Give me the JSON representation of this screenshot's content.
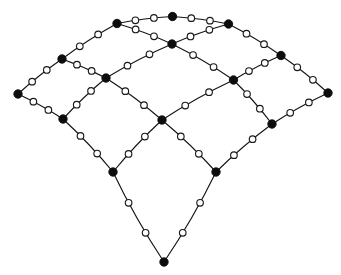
{
  "figure": {
    "background_color": "#ffffff",
    "edge_color": "#141414",
    "filled_node_color": "#0d0d0d",
    "hollow_node_fill": "#ffffff",
    "hollow_node_stroke": "#1a1a1a",
    "edge_width": 1.15,
    "filled_node_radius": 4.2,
    "hollow_node_radius": 3.3,
    "subdivisions_per_edge": 2,
    "node_legend": {
      "filled": "corner-vertex",
      "hollow": "edge-midpoint-vertex"
    }
  },
  "graph": {
    "rows": 5,
    "cols": 5,
    "corner_nodes": [
      {
        "id": "c00",
        "x": 172.5,
        "y": 16.5
      },
      {
        "id": "c01",
        "x": 117.0,
        "y": 23.5
      },
      {
        "id": "c02",
        "x": 62.0,
        "y": 59.0
      },
      {
        "id": "c03",
        "x": 18.0,
        "y": 94.0
      },
      {
        "id": "c10",
        "x": 228.5,
        "y": 24.0
      },
      {
        "id": "c11",
        "x": 172.0,
        "y": 44.0
      },
      {
        "id": "c12",
        "x": 106.0,
        "y": 78.0
      },
      {
        "id": "c13",
        "x": 63.0,
        "y": 119.0
      },
      {
        "id": "c20",
        "x": 281.0,
        "y": 55.5
      },
      {
        "id": "c21",
        "x": 233.5,
        "y": 80.0
      },
      {
        "id": "c22",
        "x": 162.0,
        "y": 120.0
      },
      {
        "id": "c23",
        "x": 113.0,
        "y": 172.0
      },
      {
        "id": "c30",
        "x": 328.0,
        "y": 93.0
      },
      {
        "id": "c31",
        "x": 272.0,
        "y": 124.0
      },
      {
        "id": "c32",
        "x": 216.0,
        "y": 172.0
      },
      {
        "id": "c33",
        "x": 164.0,
        "y": 262.0
      }
    ],
    "filled_node_count": 16,
    "hollow_node_count": 48,
    "edge_count": 24
  }
}
